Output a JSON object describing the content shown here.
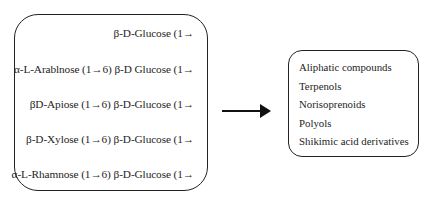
{
  "left_box": {
    "title": "Glycosidic precursors",
    "lines": [
      {
        "text": "β-D-Glucose (1→",
        "top": 27
      },
      {
        "text": "α-L-Arablnose (1→6) β-D Glucose (1→",
        "top": 63
      },
      {
        "text": "βD-Apiose (1→6) β-D-Glucose (1→",
        "top": 98
      },
      {
        "text": "β-D-Xylose (1→6) β-D-Glucose (1→",
        "top": 133
      },
      {
        "text": "α-L-Rhamnose (1→6) β-D-Glucose (1→",
        "top": 168
      }
    ]
  },
  "arrow": {
    "direction": "right"
  },
  "right_box": {
    "items": [
      "Aliphatic compounds",
      "Terpenols",
      "Norisoprenoids",
      "Polyols",
      "Shikimic acid derivatives"
    ]
  }
}
